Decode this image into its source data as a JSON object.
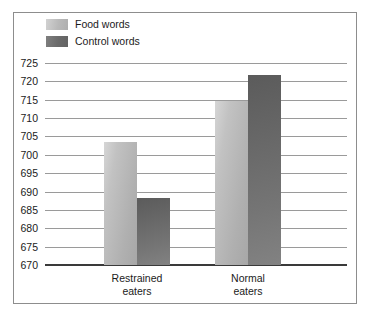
{
  "chart_data": {
    "type": "bar",
    "title": "",
    "xlabel": "",
    "ylabel": "",
    "categories": [
      "Restrained\neaters",
      "Normal\neaters"
    ],
    "series": [
      {
        "name": "Food words",
        "values": [
          703.4,
          714.7
        ],
        "color": "#bdbdbd"
      },
      {
        "name": "Control words",
        "values": [
          688.2,
          721.8
        ],
        "color": "#6b6b6b"
      }
    ],
    "ylim": [
      670,
      725
    ],
    "ytick_step": 5,
    "yticks": [
      725,
      720,
      715,
      710,
      705,
      700,
      695,
      690,
      685,
      680,
      675,
      670
    ],
    "ytick_labels": [
      "725",
      "720",
      "715",
      "710",
      "705",
      "700",
      "695",
      "690",
      "685",
      "680",
      "675",
      "670"
    ],
    "grid": true,
    "legend_position": "top-left"
  },
  "legend": {
    "items": [
      {
        "label": "Food words",
        "swatch": "food-words-swatch"
      },
      {
        "label": "Control words",
        "swatch": "control-words-swatch"
      }
    ]
  },
  "axes": {
    "x_categories": [
      {
        "line1": "Restrained",
        "line2": "eaters"
      },
      {
        "line1": "Normal",
        "line2": "eaters"
      }
    ]
  },
  "colors": {
    "food_words": "#bdbdbd",
    "control_words": "#6b6b6b",
    "gridline": "#9a9a9a",
    "axis": "#3a3a3a",
    "frame": "#8d8d8d",
    "text": "#1b1b1b",
    "background": "#ffffff"
  }
}
